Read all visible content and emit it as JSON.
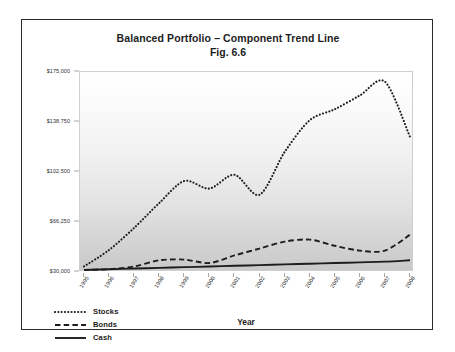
{
  "figure": {
    "title_line_1": "Balanced Portfolio – Component Trend Line",
    "title_line_2": "Fig. 6.6"
  },
  "axes": {
    "x_title": "Year",
    "y_ticks": [
      "$175,000",
      "$138,750",
      "$102,500",
      "$66,250",
      "$30,000"
    ],
    "x_ticks": [
      "1995",
      "1996",
      "1997",
      "1998",
      "1999",
      "2000",
      "2001",
      "2002",
      "2003",
      "2004",
      "2005",
      "2006",
      "2007",
      "2008"
    ]
  },
  "legend": {
    "items": [
      {
        "label": "Stocks",
        "style": "dotted"
      },
      {
        "label": "Bonds",
        "style": "dashed"
      },
      {
        "label": "Cash",
        "style": "solid"
      }
    ]
  },
  "chart_data": {
    "type": "line",
    "title": "Balanced Portfolio – Component Trend Line",
    "subtitle": "Fig. 6.6",
    "xlabel": "Year",
    "ylabel": "",
    "categories": [
      "1995",
      "1996",
      "1997",
      "1998",
      "1999",
      "2000",
      "2001",
      "2002",
      "2003",
      "2004",
      "2005",
      "2006",
      "2007",
      "2008"
    ],
    "ylim": [
      30000,
      175000
    ],
    "ytick_values": [
      30000,
      66250,
      102500,
      138750,
      175000
    ],
    "grid": false,
    "legend_position": "bottom-left",
    "series": [
      {
        "name": "Stocks",
        "style": "dotted",
        "color": "#1d1d1d",
        "values": [
          34000,
          46000,
          62000,
          80000,
          96000,
          90500,
          100500,
          86000,
          117000,
          140000,
          148000,
          158000,
          168000,
          128000
        ]
      },
      {
        "name": "Bonds",
        "style": "dashed",
        "color": "#1d1d1d",
        "values": [
          31500,
          32000,
          34000,
          38500,
          39000,
          36500,
          42000,
          47000,
          52000,
          53500,
          49000,
          45500,
          45500,
          57000
        ]
      },
      {
        "name": "Cash",
        "style": "solid",
        "color": "#1d1d1d",
        "values": [
          31500,
          32000,
          32500,
          33000,
          33500,
          34000,
          34500,
          35000,
          35500,
          36000,
          36500,
          37000,
          37500,
          38500
        ]
      }
    ]
  }
}
